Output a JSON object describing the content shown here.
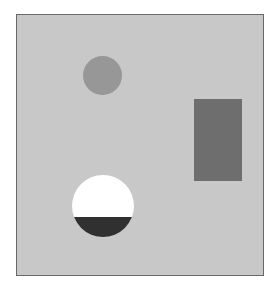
{
  "scene": {
    "description": "Abstract composition of gray shapes on a light gray panel",
    "shapes": [
      {
        "id": "small-circle",
        "kind": "circle",
        "color": "#979797"
      },
      {
        "id": "dark-rectangle",
        "kind": "rectangle",
        "color": "#6e6e6e"
      },
      {
        "id": "half-filled-circle",
        "kind": "circle",
        "top_color": "#ffffff",
        "bottom_color": "#303030"
      }
    ],
    "background_color": "#c8c8c8",
    "border_color": "#6a6a6a"
  }
}
